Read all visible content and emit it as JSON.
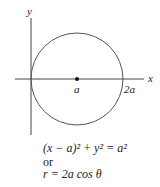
{
  "diagram": {
    "axes": {
      "x_label": "x",
      "y_label": "y"
    },
    "points": [
      {
        "label": "a",
        "marker": true
      },
      {
        "label": "2a",
        "marker": false
      }
    ],
    "curve": {
      "type": "circle",
      "center": "(a, 0)",
      "radius": "a"
    }
  },
  "equations": {
    "cartesian": "(x − a)² + y² = a²",
    "connector": "or",
    "polar": "r = 2a cos θ"
  }
}
